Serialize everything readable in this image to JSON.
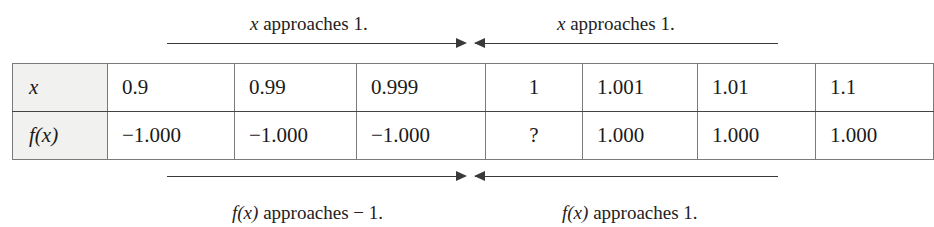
{
  "annotations": {
    "top_left": {
      "variable": "x",
      "text": " approaches 1."
    },
    "top_right": {
      "variable": "x",
      "text": " approaches 1."
    },
    "bottom_left": {
      "variable": "f(x)",
      "text": " approaches − 1."
    },
    "bottom_right": {
      "variable": "f(x)",
      "text": " approaches 1."
    }
  },
  "table": {
    "row_labels": [
      "x",
      "f(x)"
    ],
    "columns": [
      "0.9",
      "0.99",
      "0.999",
      "1",
      "1.001",
      "1.01",
      "1.1"
    ],
    "rows": [
      {
        "label": "x",
        "values": [
          "0.9",
          "0.99",
          "0.999",
          "1",
          "1.001",
          "1.01",
          "1.1"
        ]
      },
      {
        "label": "f(x)",
        "values": [
          "−1.000",
          "−1.000",
          "−1.000",
          "?",
          "1.000",
          "1.000",
          "1.000"
        ]
      }
    ]
  },
  "colors": {
    "background": "#ffffff",
    "rule": "#7a7a7a",
    "header_fill": "#f1f1ef",
    "text": "#1a1a1a",
    "arrow": "#3a3a3a"
  }
}
